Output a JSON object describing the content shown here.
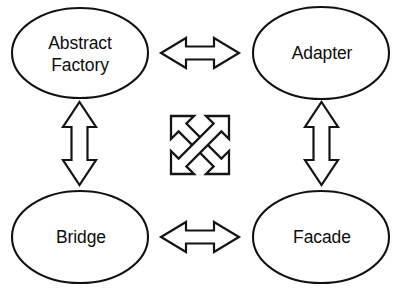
{
  "diagram": {
    "background_color": "#ffffff",
    "stroke_color": "#141414",
    "fill_color": "#ffffff",
    "text_color": "#0d0d0d",
    "nodes": [
      {
        "id": "abstract-factory",
        "label_line1": "Abstract",
        "label_line2": "Factory",
        "shape": "ellipse",
        "cx": 80,
        "cy": 53,
        "rx": 68,
        "ry": 45
      },
      {
        "id": "adapter",
        "label_line1": "Adapter",
        "label_line2": "",
        "shape": "ellipse",
        "cx": 321,
        "cy": 53,
        "rx": 68,
        "ry": 46
      },
      {
        "id": "bridge",
        "label_line1": "Bridge",
        "label_line2": "",
        "shape": "ellipse",
        "cx": 80,
        "cy": 237,
        "rx": 68,
        "ry": 46
      },
      {
        "id": "facade",
        "label_line1": "Facade",
        "label_line2": "",
        "shape": "ellipse",
        "cx": 321,
        "cy": 237,
        "rx": 68,
        "ry": 46
      }
    ],
    "connectors": [
      {
        "id": "abstract-factory-adapter",
        "from": "abstract-factory",
        "to": "adapter",
        "orientation": "horizontal",
        "kind": "double-headed-arrow"
      },
      {
        "id": "bridge-facade",
        "from": "bridge",
        "to": "facade",
        "orientation": "horizontal",
        "kind": "double-headed-arrow"
      },
      {
        "id": "abstract-factory-bridge",
        "from": "abstract-factory",
        "to": "bridge",
        "orientation": "vertical",
        "kind": "double-headed-arrow"
      },
      {
        "id": "adapter-facade",
        "from": "adapter",
        "to": "facade",
        "orientation": "vertical",
        "kind": "double-headed-arrow"
      }
    ],
    "center_icon": {
      "id": "crossed-diagonal-arrows",
      "name": "crossed-diagonal-double-arrows-icon",
      "description": "Two crossed diagonal double-headed arrows",
      "cx": 199,
      "cy": 145,
      "size": 58
    }
  }
}
